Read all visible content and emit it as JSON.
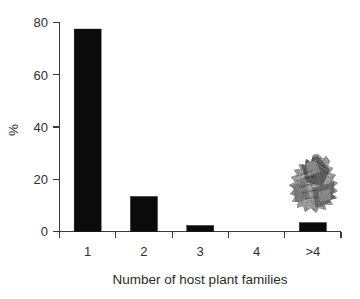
{
  "chart_data": {
    "type": "bar",
    "title": "",
    "subtitle": "",
    "xlabel": "Number of host plant families",
    "ylabel": "%",
    "categories": [
      "1",
      "2",
      "3",
      "4",
      ">4"
    ],
    "values": [
      77.5,
      13.4,
      2.3,
      0,
      3.4
    ],
    "series": [
      {
        "name": "Percentage of species",
        "values": [
          77.5,
          13.4,
          2.3,
          0,
          3.4
        ]
      }
    ],
    "ylim": [
      0,
      80
    ],
    "y_ticks": [
      0,
      20,
      40,
      60,
      80
    ],
    "y_tick_labels": [
      "0",
      "20",
      "40",
      "60",
      "80"
    ],
    "x_tick_labels": [
      "1",
      "2",
      "3",
      "4",
      ">4"
    ],
    "grid": false,
    "legend": false,
    "legend_position": "none",
    "bar_color": "#0b0b0b",
    "axis_color": "#3a3a3a",
    "background_color": "#ffffff",
    "annotations": [
      {
        "name": "insect-photograph",
        "description": "grayscale photograph of a moth specimen",
        "x_category": ">4",
        "approx_y_value": 26
      }
    ]
  },
  "figure": {
    "background": "#ffffff"
  }
}
